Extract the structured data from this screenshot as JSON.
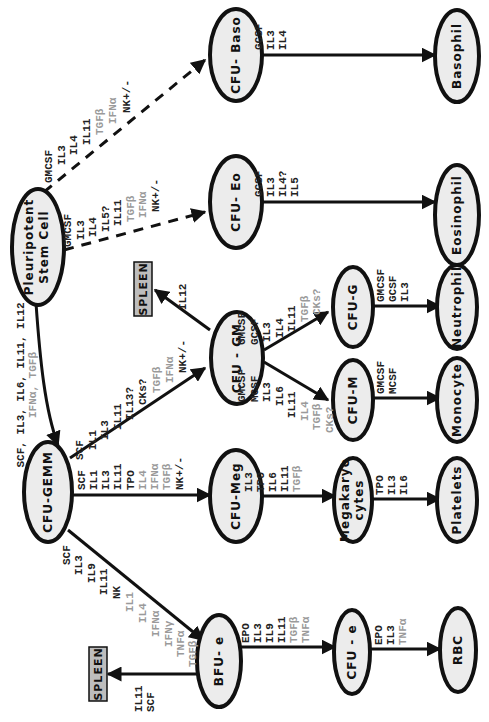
{
  "colors": {
    "stimulatory_text": "#222222",
    "inhibitory_text": "#9a9a9a",
    "node_fill": "#ececec",
    "spleen_fill": "#bdbdbd"
  },
  "nodes": {
    "stem": {
      "line1": "Pleuripotent",
      "line2": "Stem    Cell"
    },
    "gemm": {
      "label": "CFU-GEMM"
    },
    "baso": {
      "label": "CFU- Baso"
    },
    "eo": {
      "label": "CFU- Eo"
    },
    "gm": {
      "label": "CFU - GM"
    },
    "meg": {
      "label": "CFU-Meg"
    },
    "bfue": {
      "label": "BFU- e"
    },
    "cfug": {
      "label": "CFU-G"
    },
    "cfum": {
      "label": "CFU-M"
    },
    "mega": {
      "line1": "Megakaryo",
      "line2": "cytes"
    },
    "cfue": {
      "label": "CFU - e"
    },
    "basophil": {
      "label": "Basophil"
    },
    "eosinophil": {
      "label": "Eosinophil"
    },
    "neutrophil": {
      "label": "Neutrophil"
    },
    "monocyte": {
      "label": "Monocyte"
    },
    "platelets": {
      "label": "Platelets"
    },
    "rbc": {
      "label": "RBC"
    },
    "spleen_gm": {
      "label": "SPLEEN"
    },
    "spleen_e": {
      "label": "SPLEEN"
    }
  },
  "edges": {
    "stem_to_gemm": {
      "pos": [
        "SCF, IL3, IL6, IL11, IL12"
      ],
      "neg": [
        "IFNα, TGFβ"
      ]
    },
    "stem_to_baso": {
      "pos": [
        "GMCSF",
        "IL3",
        "IL4",
        "IL11"
      ],
      "neg": [
        "TGFβ",
        "IFNα"
      ],
      "tail": [
        "NK+/-"
      ]
    },
    "stem_to_eo": {
      "pos": [
        "GMCSF",
        "IL3",
        "IL4",
        "IL5?",
        "IL11"
      ],
      "neg": [
        "TGFβ",
        "IFNα"
      ],
      "tail": [
        "NK+/-"
      ]
    },
    "gemm_to_gm": {
      "pos": [
        "SCF",
        "IL1",
        "IL3",
        "IL11",
        "IL13?",
        "CKs?"
      ],
      "neg": [
        "TGFβ",
        "IFNα"
      ],
      "tail": [
        "NK+/-"
      ]
    },
    "gemm_to_meg": {
      "pos": [
        "SCF",
        "IL1",
        "IL3",
        "IL11",
        "TPO"
      ],
      "neg": [
        "IL4",
        "IFNα",
        "TGFβ"
      ],
      "tail": [
        "NK+/-"
      ]
    },
    "gemm_to_bfue": {
      "pos": [
        "SCF",
        "IL3",
        "IL9",
        "IL11",
        "NK"
      ],
      "neg": [
        "IL1",
        "IL4",
        "IFNα",
        "IFNγ",
        "TNFα",
        "TGFβ"
      ]
    },
    "gm_to_spleen": {
      "pos": [
        "IL12"
      ]
    },
    "gm_to_cfug": {
      "pos": [
        "GMCSF",
        "GCSF",
        "IL3",
        "IL4",
        "IL11"
      ],
      "neg": [
        "TGFβ",
        "CKs?"
      ]
    },
    "gm_to_cfum": {
      "pos": [
        "GMCSF",
        "MCSF",
        "IL3",
        "IL6",
        "IL11"
      ],
      "neg": [
        "IL4",
        "TGFβ",
        "CKs?"
      ]
    },
    "baso_to_basophil": {
      "pos": [
        "GCSF",
        "IL3",
        "IL4"
      ]
    },
    "eo_to_eosinophil": {
      "pos": [
        "GCSF",
        "IL3",
        "IL4?",
        "IL5"
      ]
    },
    "cfug_to_neutrophil": {
      "pos": [
        "GMCSF",
        "GCSF",
        "IL3"
      ]
    },
    "cfum_to_monocyte": {
      "pos": [
        "GMCSF",
        "MCSF"
      ]
    },
    "meg_to_mega": {
      "pos": [
        "IL3",
        "TPO",
        "IL6",
        "IL11"
      ],
      "neg": [
        "TGFβ"
      ]
    },
    "mega_to_platelets": {
      "pos": [
        "TPO",
        "IL3",
        "IL6"
      ]
    },
    "bfue_to_cfue": {
      "pos": [
        "EPO",
        "IL3",
        "IL9",
        "IL11"
      ],
      "neg": [
        "TGFβ",
        "TNFα"
      ]
    },
    "cfue_to_rbc": {
      "pos": [
        "EPO",
        "IL3"
      ],
      "neg": [
        "TNFα"
      ]
    },
    "bfue_to_spleen": {
      "pos": [
        "IL11",
        "SCF"
      ]
    }
  }
}
